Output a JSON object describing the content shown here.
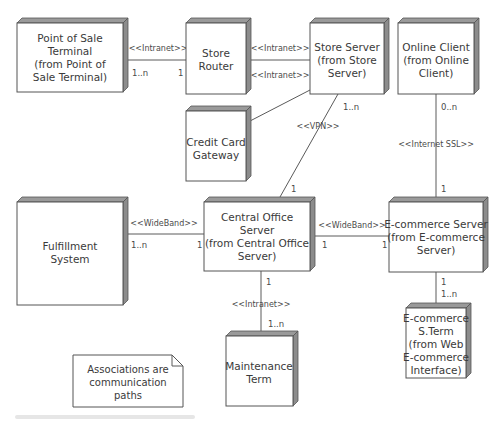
{
  "diagram": {
    "type": "UML deployment diagram",
    "nodes": [
      {
        "id": "pos",
        "lines": [
          "Point of Sale",
          "Terminal",
          "(from Point of",
          "Sale Terminal)"
        ]
      },
      {
        "id": "router",
        "lines": [
          "Store",
          "Router"
        ]
      },
      {
        "id": "storeserver",
        "lines": [
          "Store Server",
          "(from Store",
          "Server)"
        ]
      },
      {
        "id": "onlineclient",
        "lines": [
          "Online Client",
          "(from Online",
          "Client)"
        ]
      },
      {
        "id": "ccgateway",
        "lines": [
          "Credit Card",
          "Gateway"
        ]
      },
      {
        "id": "fulfillment",
        "lines": [
          "Fulfillment",
          "System"
        ]
      },
      {
        "id": "central",
        "lines": [
          "Central Office",
          "Server",
          "(from Central Office",
          "Server)"
        ]
      },
      {
        "id": "ecomserver",
        "lines": [
          "E-commerce Server",
          "(from E-commerce",
          "Server)"
        ]
      },
      {
        "id": "maintenance",
        "lines": [
          "Maintenance",
          "Term"
        ]
      },
      {
        "id": "ecomterm",
        "lines": [
          "E-commerce",
          "S.Term",
          "(from Web",
          "E-commerce",
          "Interface)"
        ]
      }
    ],
    "associations": [
      {
        "from": "pos",
        "to": "router",
        "stereotype": "<<Intranet>>",
        "from_mult": "1..n",
        "to_mult": "1"
      },
      {
        "from": "router",
        "to": "storeserver",
        "stereotype": "<<Intranet>>",
        "stereotype_2": "<<Intranet>>"
      },
      {
        "from": "ccgateway",
        "to": "storeserver"
      },
      {
        "from": "storeserver",
        "to": "central",
        "stereotype": "<<VPN>>",
        "from_mult": "1..n",
        "to_mult": "1"
      },
      {
        "from": "onlineclient",
        "to": "ecomserver",
        "stereotype": "<<Internet SSL>>",
        "from_mult": "0..n",
        "to_mult": "1"
      },
      {
        "from": "fulfillment",
        "to": "central",
        "stereotype": "<<WideBand>>",
        "from_mult": "1..n",
        "to_mult": "1"
      },
      {
        "from": "central",
        "to": "ecomserver",
        "stereotype": "<<WideBand>>",
        "from_mult": "1",
        "to_mult": "1"
      },
      {
        "from": "central",
        "to": "maintenance",
        "stereotype": "<<Intranet>>",
        "from_mult": "1",
        "to_mult": "1..n"
      },
      {
        "from": "ecomserver",
        "to": "ecomterm",
        "from_mult": "1",
        "to_mult": "1..n"
      }
    ],
    "note": {
      "lines": [
        "Associations are",
        "communication",
        "paths"
      ]
    }
  }
}
